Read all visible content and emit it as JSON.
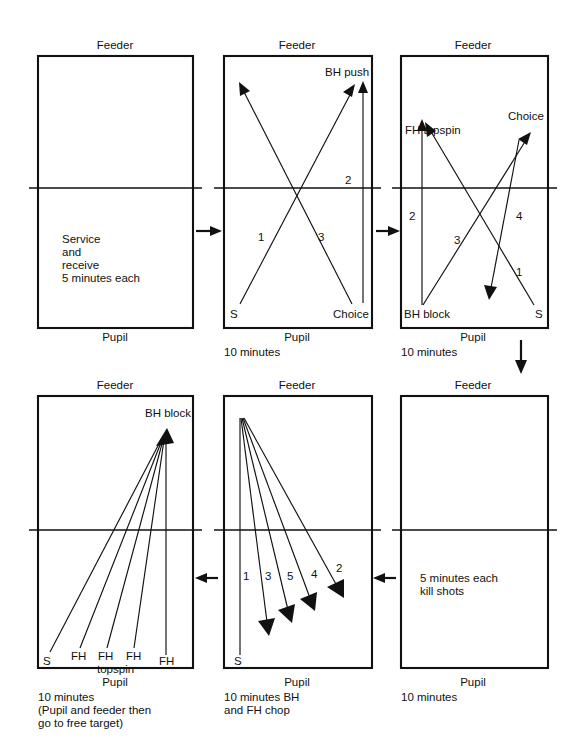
{
  "document": {
    "title": "Table tennis coaching progression diagram",
    "type": "diagram",
    "background_color": "#ffffff",
    "ink_color": "#111111"
  },
  "common_labels": {
    "feeder": "Feeder",
    "pupil": "Pupil"
  },
  "panels": [
    {
      "id": "panel-1",
      "position": "top-left",
      "top_label": "Feeder",
      "bottom_label": "Pupil",
      "caption": "",
      "inside_text": [
        "Service",
        "and",
        "receive",
        "5 minutes each"
      ],
      "shots": []
    },
    {
      "id": "panel-2",
      "position": "top-middle",
      "top_label": "Feeder",
      "bottom_label": "Pupil",
      "caption": "10 minutes",
      "inside_text": [],
      "end_labels": [
        "S",
        "BH push",
        "Choice"
      ],
      "shots": [
        {
          "number": "1",
          "from": "S",
          "to": "BH push"
        },
        {
          "number": "2",
          "from": "BH push",
          "to": "Choice"
        },
        {
          "number": "3",
          "from": "Choice",
          "to": "feeder backhand corner"
        }
      ]
    },
    {
      "id": "panel-3",
      "position": "top-right",
      "top_label": "Feeder",
      "bottom_label": "Pupil",
      "caption": "10 minutes",
      "inside_text": [],
      "end_labels": [
        "S",
        "FH topspin",
        "BH block",
        "Choice"
      ],
      "shots": [
        {
          "number": "1",
          "from": "S",
          "to": "FH topspin"
        },
        {
          "number": "2",
          "from": "BH block",
          "to": "FH topspin"
        },
        {
          "number": "3",
          "from": "BH block",
          "to": "Choice"
        },
        {
          "number": "4",
          "from": "Choice",
          "to": "pupil forehand side"
        }
      ]
    },
    {
      "id": "panel-4",
      "position": "bottom-left",
      "top_label": "Feeder",
      "bottom_label": "Pupil",
      "caption": "10 minutes\n(Pupil and feeder then\ngo to free target)",
      "caption_lines": [
        "10 minutes",
        "(Pupil and feeder then",
        "go to free target)"
      ],
      "inside_text": [],
      "target_label": "BH block",
      "origin_labels": [
        "S",
        "FH",
        "FH",
        "FH",
        "FH"
      ],
      "origin_sub_label": "topspin",
      "shots": [
        {
          "number": "",
          "from": "S",
          "to": "BH block"
        },
        {
          "number": "",
          "from": "FH",
          "to": "BH block"
        },
        {
          "number": "",
          "from": "FH topspin",
          "to": "BH block"
        },
        {
          "number": "",
          "from": "FH",
          "to": "BH block"
        },
        {
          "number": "",
          "from": "FH",
          "to": "BH block"
        }
      ]
    },
    {
      "id": "panel-5",
      "position": "bottom-middle",
      "top_label": "Feeder",
      "bottom_label": "Pupil",
      "caption_lines": [
        "10 minutes BH",
        "and FH chop"
      ],
      "inside_text": [],
      "end_labels": [
        "S"
      ],
      "shots": [
        {
          "number": "1",
          "from": "feeder backhand corner",
          "to": "S"
        },
        {
          "number": "3",
          "from": "feeder backhand corner",
          "to": "pupil middle"
        },
        {
          "number": "5",
          "from": "feeder backhand corner",
          "to": "pupil middle"
        },
        {
          "number": "4",
          "from": "feeder backhand corner",
          "to": "pupil forehand"
        },
        {
          "number": "2",
          "from": "feeder backhand corner",
          "to": "pupil wide forehand"
        }
      ]
    },
    {
      "id": "panel-6",
      "position": "bottom-right",
      "top_label": "Feeder",
      "bottom_label": "Pupil",
      "caption_lines": [
        "10 minutes"
      ],
      "inside_text": [
        "5 minutes each",
        "kill shots"
      ],
      "shots": []
    }
  ],
  "flow_arrows": [
    {
      "id": "flow-1-2",
      "direction": "right",
      "from_panel": "panel-1",
      "to_panel": "panel-2"
    },
    {
      "id": "flow-2-3",
      "direction": "right",
      "from_panel": "panel-2",
      "to_panel": "panel-3"
    },
    {
      "id": "flow-3-6",
      "direction": "down",
      "from_panel": "panel-3",
      "to_panel": "panel-6"
    },
    {
      "id": "flow-6-5",
      "direction": "left",
      "from_panel": "panel-6",
      "to_panel": "panel-5"
    },
    {
      "id": "flow-5-4",
      "direction": "left",
      "from_panel": "panel-5",
      "to_panel": "panel-4"
    }
  ]
}
